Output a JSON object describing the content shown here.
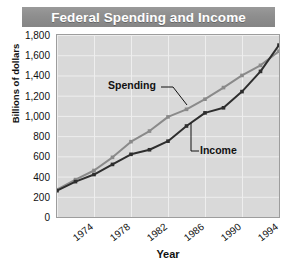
{
  "header": {
    "title": "Federal Spending and Income"
  },
  "axes": {
    "ylabel": "Billions of dollars",
    "xlabel": "Year",
    "yticks": [
      "0",
      "200",
      "400",
      "600",
      "800",
      "1,000",
      "1,200",
      "1,400",
      "1,600",
      "1,800"
    ],
    "xticks": [
      "1974",
      "1978",
      "1982",
      "1986",
      "1990",
      "1994",
      "1998"
    ]
  },
  "annotations": {
    "spending": "Spending",
    "income": "Income"
  },
  "colors": {
    "title_bar": "#8e8e8e",
    "title_text": "#ffffff",
    "plot_background": "#d9d9d9",
    "gridline": "#eeeeee",
    "spending_line": "#8a8a8a",
    "income_line": "#2e2e2e",
    "axis_text": "#111111"
  },
  "chart_data": {
    "type": "line",
    "title": "Federal Spending and Income",
    "xlabel": "Year",
    "ylabel": "Billions of dollars",
    "xlim": [
      1974,
      1998
    ],
    "ylim": [
      0,
      1800
    ],
    "ytick_step": 200,
    "grid": true,
    "legend": "inline-annotations",
    "x": [
      1974,
      1976,
      1978,
      1980,
      1982,
      1984,
      1986,
      1988,
      1990,
      1992,
      1994,
      1996,
      1998
    ],
    "series": [
      {
        "name": "Spending",
        "color": "#8a8a8a",
        "values": [
          270,
          370,
          460,
          590,
          745,
          850,
          990,
          1065,
          1165,
          1280,
          1400,
          1500,
          1640
        ]
      },
      {
        "name": "Income",
        "color": "#2e2e2e",
        "values": [
          260,
          350,
          420,
          520,
          620,
          665,
          750,
          900,
          1030,
          1080,
          1240,
          1440,
          1700
        ]
      }
    ]
  }
}
